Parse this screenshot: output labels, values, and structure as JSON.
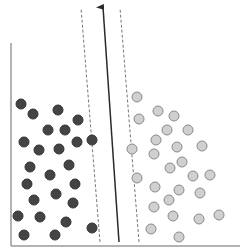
{
  "diagram": {
    "type": "svm-separating-hyperplane",
    "colors": {
      "axis": "#9a9a9a",
      "class_a_fill": "#444444",
      "class_a_stroke": "#333333",
      "class_b_fill": "#d0d0d0",
      "class_b_stroke": "#8a8a8a",
      "hyperplane": "#2a2a2a",
      "margin": "#777777"
    },
    "axes": {
      "y_axis": {
        "x": 11,
        "y1": 43,
        "y2": 246
      },
      "x_axis": {
        "y": 246,
        "x1": 11,
        "x2": 240
      }
    },
    "hyperplane": {
      "x1": 119,
      "y1": 242,
      "x2": 103,
      "y2": 7
    },
    "margins": [
      {
        "x1": 100,
        "y1": 242,
        "x2": 81,
        "y2": 8
      },
      {
        "x1": 139,
        "y1": 242,
        "x2": 120,
        "y2": 8
      }
    ],
    "class_a_points": [
      [
        21,
        104
      ],
      [
        33,
        114
      ],
      [
        58,
        110
      ],
      [
        78,
        120
      ],
      [
        48,
        130
      ],
      [
        65,
        130
      ],
      [
        24,
        142
      ],
      [
        39,
        150
      ],
      [
        59,
        149
      ],
      [
        77,
        142
      ],
      [
        92,
        140
      ],
      [
        30,
        167
      ],
      [
        50,
        175
      ],
      [
        69,
        165
      ],
      [
        27,
        184
      ],
      [
        75,
        184
      ],
      [
        34,
        200
      ],
      [
        56,
        194
      ],
      [
        73,
        203
      ],
      [
        18,
        216
      ],
      [
        40,
        217
      ],
      [
        66,
        222
      ],
      [
        92,
        228
      ],
      [
        24,
        235
      ],
      [
        55,
        235
      ]
    ],
    "class_b_points": [
      [
        137,
        97
      ],
      [
        139,
        119
      ],
      [
        158,
        111
      ],
      [
        174,
        116
      ],
      [
        167,
        130
      ],
      [
        188,
        130
      ],
      [
        132,
        149
      ],
      [
        156,
        140
      ],
      [
        177,
        147
      ],
      [
        202,
        146
      ],
      [
        154,
        154
      ],
      [
        182,
        162
      ],
      [
        170,
        168
      ],
      [
        137,
        178
      ],
      [
        193,
        176
      ],
      [
        210,
        175
      ],
      [
        155,
        187
      ],
      [
        179,
        190
      ],
      [
        200,
        193
      ],
      [
        169,
        200
      ],
      [
        154,
        207
      ],
      [
        173,
        216
      ],
      [
        199,
        219
      ],
      [
        219,
        215
      ],
      [
        151,
        229
      ],
      [
        179,
        237
      ]
    ],
    "point_radius": 5
  }
}
